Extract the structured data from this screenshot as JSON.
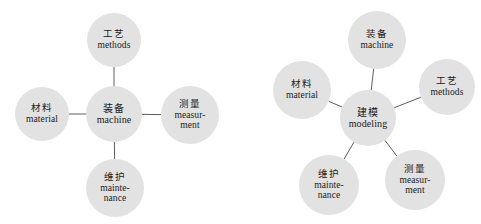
{
  "figure": {
    "background_color": "#ffffff",
    "node_fill_color": "#e2e2e2",
    "edge_color": "#4a4a4a",
    "text_color": "#1a1a1a"
  },
  "diagrams": [
    {
      "id": "left-cross-diagram",
      "layout": "cross",
      "center": {
        "id": "machine-center",
        "cn": "装备",
        "en": [
          "machine"
        ],
        "cx": 114,
        "cy": 114,
        "r": 28
      },
      "nodes": [
        {
          "id": "methods",
          "cn": "工艺",
          "en": [
            "methods"
          ],
          "cx": 114,
          "cy": 40,
          "r": 27
        },
        {
          "id": "material",
          "cn": "材料",
          "en": [
            "material"
          ],
          "cx": 42,
          "cy": 114,
          "r": 27
        },
        {
          "id": "measurment",
          "cn": "测量",
          "en": [
            "measur-",
            "ment"
          ],
          "cx": 190,
          "cy": 115,
          "r": 29
        },
        {
          "id": "maintenance",
          "cn": "维护",
          "en": [
            "mainte-",
            "nance"
          ],
          "cx": 115,
          "cy": 188,
          "r": 29
        }
      ],
      "edges": [
        {
          "from": "machine-center",
          "to": "methods"
        },
        {
          "from": "machine-center",
          "to": "material"
        },
        {
          "from": "machine-center",
          "to": "measurment"
        },
        {
          "from": "machine-center",
          "to": "maintenance"
        }
      ]
    },
    {
      "id": "right-star-diagram",
      "layout": "radial-star",
      "center": {
        "id": "modeling-center",
        "cn": "建模",
        "en": [
          "modeling"
        ],
        "cx": 368,
        "cy": 118,
        "r": 28
      },
      "nodes": [
        {
          "id": "machine",
          "cn": "装备",
          "en": [
            "machine"
          ],
          "cx": 377,
          "cy": 40,
          "r": 29
        },
        {
          "id": "material",
          "cn": "材料",
          "en": [
            "material"
          ],
          "cx": 302,
          "cy": 90,
          "r": 29
        },
        {
          "id": "methods",
          "cn": "工艺",
          "en": [
            "methods"
          ],
          "cx": 447,
          "cy": 87,
          "r": 28
        },
        {
          "id": "maintenance",
          "cn": "维护",
          "en": [
            "mainte-",
            "nance"
          ],
          "cx": 329,
          "cy": 185,
          "r": 30
        },
        {
          "id": "measurment",
          "cn": "测量",
          "en": [
            "measur-",
            "ment"
          ],
          "cx": 415,
          "cy": 180,
          "r": 30
        }
      ],
      "edges": [
        {
          "from": "modeling-center",
          "to": "machine"
        },
        {
          "from": "modeling-center",
          "to": "material"
        },
        {
          "from": "modeling-center",
          "to": "methods"
        },
        {
          "from": "modeling-center",
          "to": "maintenance"
        },
        {
          "from": "modeling-center",
          "to": "measurment"
        }
      ]
    }
  ]
}
